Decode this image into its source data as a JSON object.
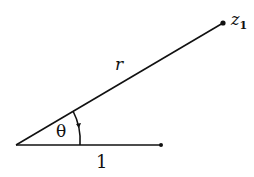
{
  "diagram": {
    "labels": {
      "radius": "r",
      "angle": "θ",
      "unit": "1",
      "point": "z",
      "point_subscript": "1"
    },
    "geometry": {
      "origin": [
        16,
        145
      ],
      "unit_end": [
        161,
        145
      ],
      "point_z1": [
        223,
        23
      ]
    },
    "colors": {
      "stroke": "#111111",
      "background": "#ffffff"
    }
  }
}
